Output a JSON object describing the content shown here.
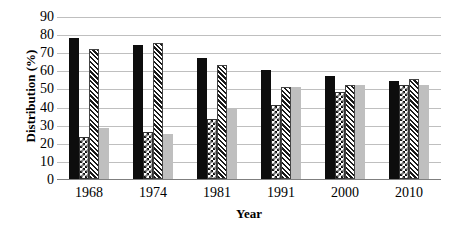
{
  "chart_data": {
    "type": "bar",
    "title": "",
    "subtitle": "",
    "xlabel": "Year",
    "ylabel": "Distribution (%)",
    "categories": [
      "1968",
      "1974",
      "1981",
      "1991",
      "2000",
      "2010"
    ],
    "series": [
      {
        "name": "series-1",
        "style": "solid-black",
        "color": "#0d0d0d",
        "values": [
          78,
          74,
          67,
          60,
          57,
          54
        ]
      },
      {
        "name": "series-2",
        "style": "checkerboard",
        "color": "#111111",
        "values": [
          23,
          26,
          33,
          41,
          48,
          52
        ]
      },
      {
        "name": "series-3",
        "style": "diagonal-hatch",
        "color": "#1a1a1a",
        "values": [
          72,
          75,
          63,
          51,
          52,
          55
        ]
      },
      {
        "name": "series-4",
        "style": "solid-gray",
        "color": "#bfbfbf",
        "values": [
          28,
          25,
          39,
          51,
          52,
          52
        ]
      }
    ],
    "ylim": [
      0,
      90
    ],
    "ytick_step": 10,
    "yticks": [
      "90",
      "80",
      "70",
      "60",
      "50",
      "40",
      "30",
      "20",
      "10",
      "0"
    ],
    "grid": true,
    "grid_color": "#bfbfbf",
    "legend": "none",
    "legend_position": "none",
    "background": "#ffffff"
  }
}
